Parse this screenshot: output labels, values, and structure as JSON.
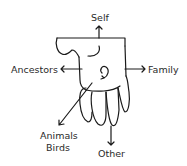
{
  "diagram": {
    "type": "hand-relationship-diagram",
    "center_icon": "hand-icon",
    "labels": {
      "top": "Self",
      "left": "Ancestors",
      "right": "Family",
      "bottom_left_line1": "Animals",
      "bottom_left_line2": "Birds",
      "bottom": "Other"
    },
    "colors": {
      "stroke": "#1a1a1a",
      "text": "#2a2a2a",
      "background": "#ffffff"
    }
  }
}
